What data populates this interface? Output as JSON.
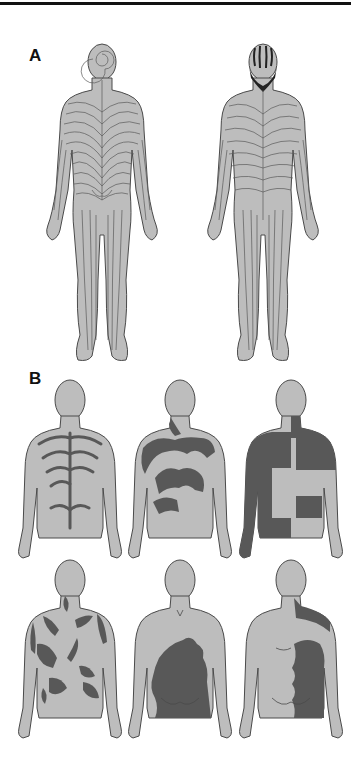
{
  "figure": {
    "panels": [
      {
        "label": "A",
        "description": "Blaschko lines on the human body",
        "figures": [
          {
            "view": "back",
            "pattern": "blaschko-lines",
            "detail": "spiral on scalp, V-shapes over spine, S-shapes on flanks"
          },
          {
            "view": "front",
            "pattern": "blaschko-lines",
            "detail": "dark stripes on scalp and face, lines on trunk and limbs"
          }
        ]
      },
      {
        "label": "B",
        "description": "Patterns of cutaneous mosaicism (back views)",
        "figures": [
          {
            "view": "back",
            "pattern": "narrow-bands-along-blaschko-lines"
          },
          {
            "view": "back",
            "pattern": "broad-bands-along-blaschko-lines"
          },
          {
            "view": "back",
            "pattern": "checkerboard"
          },
          {
            "view": "back",
            "pattern": "phylloid"
          },
          {
            "view": "back",
            "pattern": "patchy-without-midline-separation"
          },
          {
            "view": "back",
            "pattern": "lateralization"
          }
        ]
      }
    ]
  },
  "colors": {
    "skin": "#bdbdbd",
    "outline": "#4a4a4a",
    "lesion": "#585858",
    "rule": "#111111",
    "background": "#ffffff"
  }
}
